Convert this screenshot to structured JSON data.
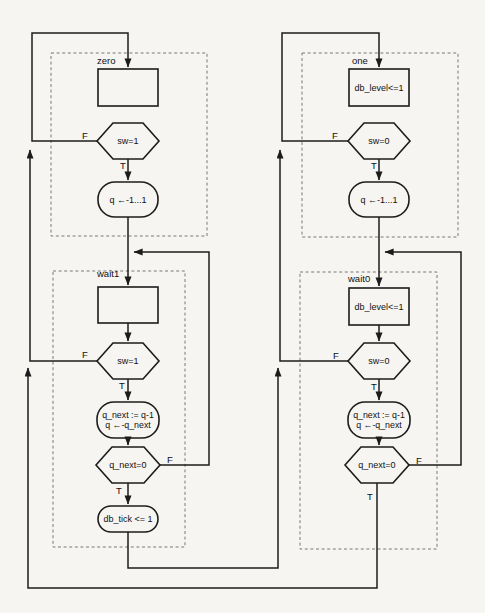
{
  "diagram_type": "asm-chart",
  "labels": {
    "false": "F",
    "true": "T"
  },
  "states": {
    "zero": {
      "name": "zero",
      "decision": "sw=1",
      "action": "q ←-1...1"
    },
    "one": {
      "name": "one",
      "register_op": "db_level<=1",
      "decision": "sw=0",
      "action": "q ←-1...1"
    },
    "wait1": {
      "name": "wait1",
      "decision": "sw=1",
      "action1": "q_next := q-1",
      "action2": "q ←-q_next",
      "counter_decision": "q_next=0",
      "output": "db_tick <= 1"
    },
    "wait0": {
      "name": "wait0",
      "register_op": "db_level<=1",
      "decision": "sw=0",
      "action1": "q_next := q-1",
      "action2": "q ←-q_next",
      "counter_decision": "q_next=0"
    }
  },
  "colors": {
    "line": "#1c1c1c",
    "dashed": "#787878",
    "background": "#f6f5f1",
    "text": "#111111"
  }
}
